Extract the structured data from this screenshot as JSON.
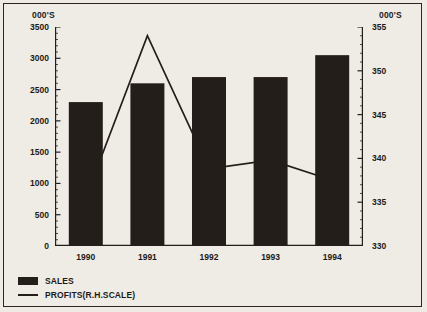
{
  "chart_data": {
    "type": "bar",
    "title": "",
    "xlabel": "",
    "ylabel": "000'S",
    "y2label": "000'S",
    "categories": [
      "1990",
      "1991",
      "1992",
      "1993",
      "1994"
    ],
    "grid": false,
    "legend_position": "bottom-left",
    "ylim": [
      0,
      3500
    ],
    "ytick_step": 500,
    "yticks": [
      "3500",
      "3000",
      "2500",
      "2000",
      "1500",
      "1000",
      "500",
      "0"
    ],
    "y2lim": [
      330,
      355
    ],
    "y2tick_step": 5,
    "y2ticks": [
      "355",
      "350",
      "345",
      "340",
      "335",
      "330"
    ],
    "series": [
      {
        "name": "SALES",
        "axis": "left",
        "type": "bar",
        "color": "#241e1a",
        "values": [
          2300,
          2600,
          2700,
          2700,
          3050
        ]
      },
      {
        "name": "PROFITS(R.H.SCALE)",
        "axis": "right",
        "type": "line",
        "color": "#241e1a",
        "values": [
          335.5,
          354.0,
          338.8,
          339.8,
          337.5
        ]
      }
    ]
  },
  "axes": {
    "left_caption": "000'S",
    "right_caption": "000'S"
  },
  "legend": {
    "items": [
      {
        "label": "SALES",
        "marker": "box"
      },
      {
        "label": "PROFITS(R.H.SCALE)",
        "marker": "line"
      }
    ]
  }
}
